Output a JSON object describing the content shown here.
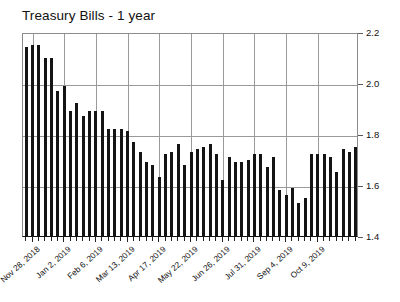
{
  "chart_data": {
    "type": "bar",
    "title": "Treasury Bills - 1 year",
    "xlabel": "",
    "ylabel": "",
    "ylim": [
      1.4,
      2.2
    ],
    "ytick_values": [
      1.4,
      1.6,
      1.8,
      2.0,
      2.2
    ],
    "ytick_labels": [
      "1.4",
      "1.6",
      "1.8",
      "2.0",
      "2.2"
    ],
    "grid": true,
    "legend": "none",
    "bar_color": "#141414",
    "grid_color": "#9a9a9a",
    "axis_color": "#8c8c8c",
    "categories": [
      "Nov 21, 2018",
      "Nov 28, 2018",
      "Dec 5, 2018",
      "Dec 12, 2018",
      "Dec 19, 2018",
      "Dec 26, 2018",
      "Jan 2, 2019",
      "Jan 9, 2019",
      "Jan 16, 2019",
      "Jan 23, 2019",
      "Jan 30, 2019",
      "Feb 6, 2019",
      "Feb 13, 2019",
      "Feb 20, 2019",
      "Feb 27, 2019",
      "Mar 6, 2019",
      "Mar 13, 2019",
      "Mar 20, 2019",
      "Mar 27, 2019",
      "Apr 3, 2019",
      "Apr 10, 2019",
      "Apr 17, 2019",
      "Apr 24, 2019",
      "May 1, 2019",
      "May 8, 2019",
      "May 15, 2019",
      "May 22, 2019",
      "May 29, 2019",
      "Jun 5, 2019",
      "Jun 12, 2019",
      "Jun 19, 2019",
      "Jun 26, 2019",
      "Jul 3, 2019",
      "Jul 10, 2019",
      "Jul 17, 2019",
      "Jul 24, 2019",
      "Jul 31, 2019",
      "Aug 7, 2019",
      "Aug 14, 2019",
      "Aug 21, 2019",
      "Aug 28, 2019",
      "Sep 4, 2019",
      "Sep 11, 2019",
      "Sep 18, 2019",
      "Sep 25, 2019",
      "Oct 2, 2019",
      "Oct 9, 2019",
      "Oct 16, 2019",
      "Oct 23, 2019",
      "Oct 30, 2019",
      "Nov 6, 2019",
      "Nov 13, 2019",
      "Nov 20, 2019"
    ],
    "values": [
      2.14,
      2.15,
      2.15,
      2.1,
      2.1,
      1.97,
      1.99,
      1.89,
      1.92,
      1.87,
      1.89,
      1.89,
      1.89,
      1.82,
      1.82,
      1.82,
      1.81,
      1.77,
      1.73,
      1.69,
      1.68,
      1.63,
      1.72,
      1.73,
      1.76,
      1.68,
      1.73,
      1.74,
      1.75,
      1.76,
      1.72,
      1.62,
      1.71,
      1.69,
      1.69,
      1.7,
      1.72,
      1.72,
      1.67,
      1.71,
      1.58,
      1.56,
      1.59,
      1.53,
      1.55,
      1.72,
      1.72,
      1.72,
      1.71,
      1.65,
      1.74,
      1.73,
      1.75
    ],
    "visible_xtick_labels": [
      {
        "index": 1,
        "label": "Nov 28, 2018"
      },
      {
        "index": 6,
        "label": "Jan 2, 2019"
      },
      {
        "index": 11,
        "label": "Feb 6, 2019"
      },
      {
        "index": 16,
        "label": "Mar 13, 2019"
      },
      {
        "index": 21,
        "label": "Apr 17, 2019"
      },
      {
        "index": 26,
        "label": "May 22, 2019"
      },
      {
        "index": 31,
        "label": "Jun 26, 2019"
      },
      {
        "index": 36,
        "label": "Jul 31, 2019"
      },
      {
        "index": 41,
        "label": "Sep 4, 2019"
      },
      {
        "index": 46,
        "label": "Oct 9, 2019"
      }
    ]
  }
}
